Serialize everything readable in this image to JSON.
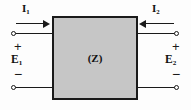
{
  "diagram": {
    "box": {
      "label": "(Z)",
      "fill_color": "#c6c6c6",
      "stroke_color": "#1a1a1a"
    },
    "ports": {
      "left": {
        "current_label": "I",
        "current_subscript": "1",
        "current_direction": "right",
        "voltage_label": "E",
        "voltage_subscript": "1",
        "top_sign": "+",
        "bottom_sign": "−"
      },
      "right": {
        "current_label": "I",
        "current_subscript": "2",
        "current_direction": "left",
        "voltage_label": "E",
        "voltage_subscript": "2",
        "top_sign": "+",
        "bottom_sign": "−"
      }
    },
    "background_color": "#fdfdfd",
    "line_color": "#1a1a1a"
  }
}
